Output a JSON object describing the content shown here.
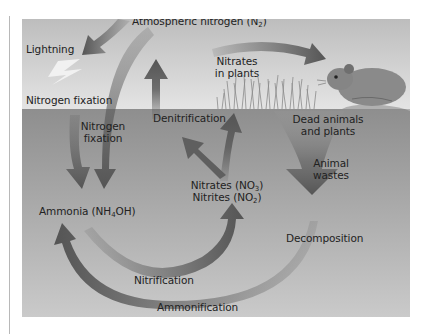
{
  "figure": {
    "colors": {
      "sky_top": "#bdbdbd",
      "sky_bottom": "#e6e6e6",
      "soil_top": "#8f8f8f",
      "soil_bottom": "#c9c9c9",
      "arrow": "#5a5a5a",
      "margin_rule": "#b8b8b8"
    },
    "labels": {
      "atmospheric_nitrogen": {
        "text": "Atmospheric nitrogen (N",
        "sub": "2",
        "tail": ")"
      },
      "lightning": "Lightning",
      "nitrogen_fixation_surface": "Nitrogen fixation",
      "nitrogen_fixation_soil_line1": "Nitrogen",
      "nitrogen_fixation_soil_line2": "fixation",
      "nitrates_in_plants_line1": "Nitrates",
      "nitrates_in_plants_line2": "in plants",
      "denitrification": "Denitrification",
      "dead_animals_line1": "Dead animals",
      "dead_animals_line2": "and plants",
      "animal_wastes_line1": "Animal",
      "animal_wastes_line2": "wastes",
      "ammonia": {
        "text": "Ammonia (NH",
        "sub": "4",
        "tail": "OH)"
      },
      "nitrates": {
        "text": "Nitrates (NO",
        "sub": "3",
        "tail": ")"
      },
      "nitrites": {
        "text": "Nitrites (NO",
        "sub": "2",
        "tail": ")"
      },
      "decomposition": "Decomposition",
      "nitrification": "Nitrification",
      "ammonification": "Ammonification"
    },
    "illustrations": {
      "animal": "rodent-illustration",
      "grass": "grass-illustration",
      "lightning": "lightning-bolt"
    }
  }
}
